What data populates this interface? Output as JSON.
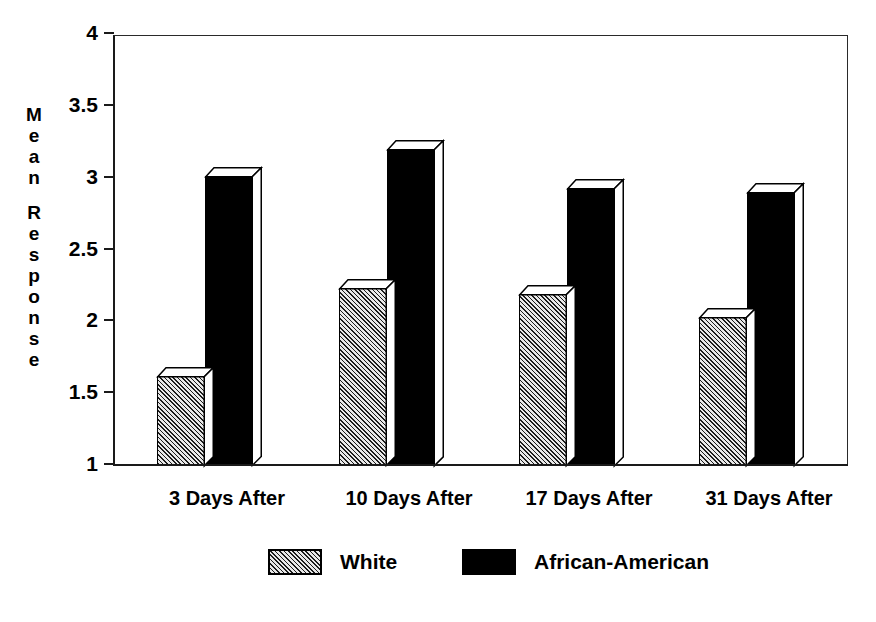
{
  "chart_data": {
    "type": "bar",
    "title": "",
    "subtitle": "",
    "xlabel": "",
    "ylabel": "Mean Response",
    "categories": [
      "3 Days After",
      "10 Days After",
      "17 Days After",
      "31 Days After"
    ],
    "series": [
      {
        "name": "White",
        "values": [
          1.62,
          2.23,
          2.19,
          2.03
        ],
        "fill": "hatched",
        "color": "#c9c9c9"
      },
      {
        "name": "African-American",
        "values": [
          3.01,
          3.2,
          2.93,
          2.9
        ],
        "fill": "solid",
        "color": "#000000"
      }
    ],
    "ylim": [
      1,
      4
    ],
    "yticks": [
      1,
      1.5,
      2,
      2.5,
      3,
      3.5,
      4
    ],
    "ytick_labels": [
      "1",
      "1.5",
      "2",
      "2.5",
      "3",
      "3.5",
      "4"
    ],
    "grid": false,
    "legend_position": "bottom",
    "style": "3d-bar",
    "axis_color": "#1a1a1a"
  },
  "ylabel_chars": {
    "word1": [
      "M",
      "e",
      "a",
      "n"
    ],
    "word2": [
      "R",
      "e",
      "s",
      "p",
      "o",
      "n",
      "s",
      "e"
    ]
  },
  "legend": {
    "items": [
      {
        "label": "White",
        "swatch": "hatched-swatch"
      },
      {
        "label": "African-American",
        "swatch": "solid-black-swatch"
      }
    ]
  }
}
